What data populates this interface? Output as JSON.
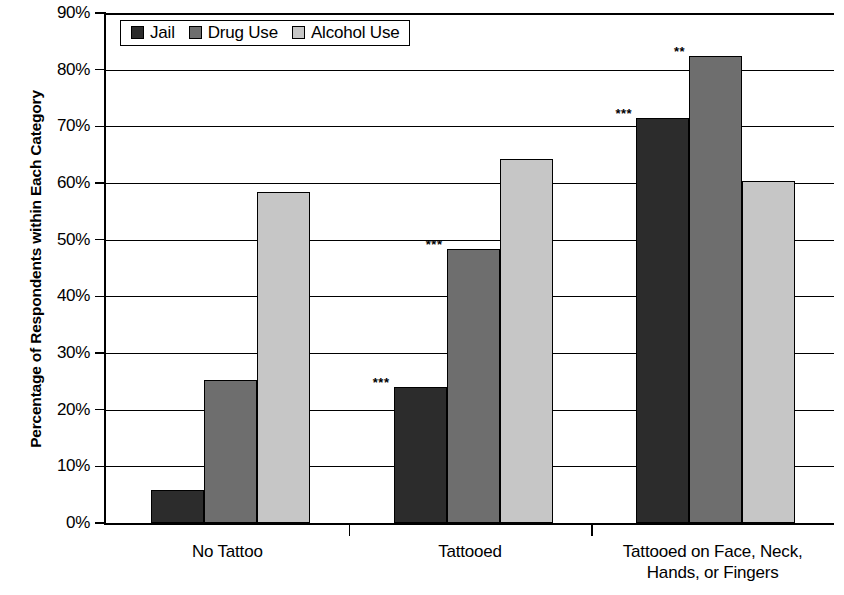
{
  "chart_data": {
    "type": "bar",
    "title": "",
    "xlabel": "",
    "ylabel": "Percentage of Respondents within Each Category",
    "ylim": [
      0,
      90
    ],
    "ytick_labels": [
      "0%",
      "10%",
      "20%",
      "30%",
      "40%",
      "50%",
      "60%",
      "70%",
      "80%",
      "90%"
    ],
    "ytick_values": [
      0,
      10,
      20,
      30,
      40,
      50,
      60,
      70,
      80,
      90
    ],
    "grid": "horizontal",
    "legend_position": "top-left-inside",
    "categories": [
      "No Tattoo",
      "Tattooed",
      "Tattooed on Face, Neck, Hands, or Fingers"
    ],
    "category_lines": [
      [
        "No Tattoo"
      ],
      [
        "Tattooed"
      ],
      [
        "Tattooed on Face, Neck,",
        "Hands, or Fingers"
      ]
    ],
    "series": [
      {
        "name": "Jail",
        "color": "#2c2c2c",
        "values": [
          5.8,
          24.0,
          71.5
        ],
        "annotations": [
          "",
          "***",
          "***"
        ]
      },
      {
        "name": "Drug Use",
        "color": "#6e6e6e",
        "values": [
          25.3,
          48.3,
          82.5
        ],
        "annotations": [
          "",
          "***",
          "**"
        ]
      },
      {
        "name": "Alcohol Use",
        "color": "#c6c6c6",
        "values": [
          58.5,
          64.2,
          60.3
        ],
        "annotations": [
          "",
          "",
          ""
        ]
      }
    ]
  },
  "legend": {
    "items": [
      {
        "label": "Jail",
        "color": "#2c2c2c"
      },
      {
        "label": "Drug Use",
        "color": "#6e6e6e"
      },
      {
        "label": "Alcohol Use",
        "color": "#c6c6c6"
      }
    ]
  }
}
